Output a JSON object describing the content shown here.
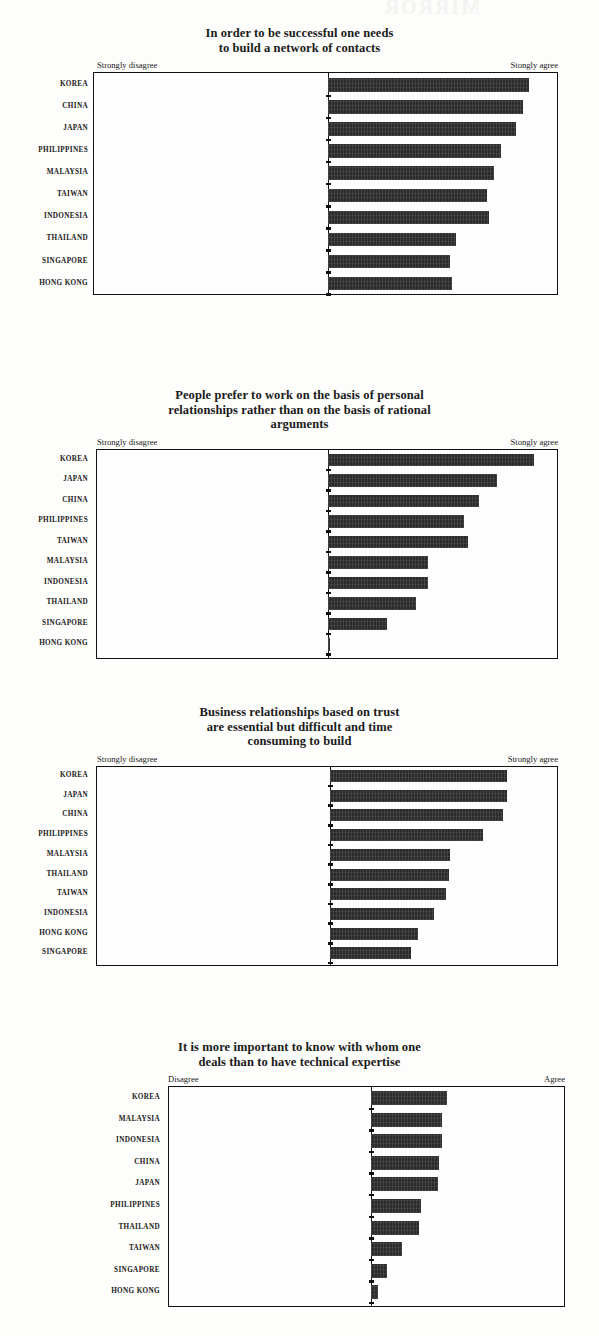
{
  "page": {
    "artifact_text": "MIRROR"
  },
  "chart_data": [
    {
      "id": "chart-1",
      "type": "bar",
      "orientation": "horizontal",
      "title": "In order to be successful one needs to build a network of contacts",
      "title_lines": [
        "In order to be successful one needs",
        "to build a network of contacts"
      ],
      "xlabel_left": "Strongly disagree",
      "xlabel_right": "Stongly agree",
      "categories": [
        "KOREA",
        "CHINA",
        "JAPAN",
        "PHILIPPINES",
        "MALAYSIA",
        "TAIWAN",
        "INDONESIA",
        "THAILAND",
        "SINGAPORE",
        "HONG KONG"
      ],
      "values": [
        87.0,
        84.5,
        81.5,
        75.0,
        72.0,
        69.0,
        69.5,
        55.5,
        53.0,
        53.5
      ],
      "xlim": [
        0,
        100
      ],
      "grid": false,
      "legend": "none"
    },
    {
      "id": "chart-2",
      "type": "bar",
      "orientation": "horizontal",
      "title": "People prefer to work on the basis of personal relationships rather than on the basis of rational arguments",
      "title_lines": [
        "People prefer to work on the basis of personal",
        "relationships rather than on the basis of rational",
        "arguments"
      ],
      "xlabel_left": "Strongly disagree",
      "xlabel_right": "Stongly agree",
      "categories": [
        "KOREA",
        "JAPAN",
        "CHINA",
        "PHILIPPINES",
        "TAIWAN",
        "MALAYSIA",
        "INDONESIA",
        "THAILAND",
        "SINGAPORE",
        "HONG KONG"
      ],
      "values": [
        89.0,
        73.0,
        65.5,
        59.0,
        60.5,
        43.5,
        43.5,
        38.0,
        25.5,
        0.8
      ],
      "xlim": [
        0,
        100
      ],
      "grid": false,
      "legend": "none"
    },
    {
      "id": "chart-3",
      "type": "bar",
      "orientation": "horizontal",
      "title": "Business relationships based on trust are essential but difficult and time consuming to build",
      "title_lines": [
        "Business relationships based on trust",
        "are essential but difficult and time",
        "consuming to build"
      ],
      "xlabel_left": "Strongly disagree",
      "xlabel_right": "Strongly agree",
      "categories": [
        "KOREA",
        "JAPAN",
        "CHINA",
        "PHILIPPINES",
        "MALAYSIA",
        "THAILAND",
        "TAIWAN",
        "INDONESIA",
        "HONG KONG",
        "SINGAPORE"
      ],
      "values": [
        77.5,
        77.5,
        75.5,
        67.0,
        52.5,
        52.0,
        50.5,
        45.5,
        38.5,
        35.5
      ],
      "xlim": [
        0,
        100
      ],
      "grid": false,
      "legend": "none"
    },
    {
      "id": "chart-4",
      "type": "bar",
      "orientation": "horizontal",
      "title": "It is more important to know with whom one deals than to have technical expertise",
      "title_lines": [
        "It is more important to know with whom one",
        "deals than to have technical expertise"
      ],
      "xlabel_left": "Disagree",
      "xlabel_right": "Agree",
      "categories": [
        "KOREA",
        "MALAYSIA",
        "INDONESIA",
        "CHINA",
        "JAPAN",
        "PHILIPPINES",
        "THAILAND",
        "TAIWAN",
        "SINGAPORE",
        "HONG KONG"
      ],
      "values": [
        39.0,
        36.5,
        36.5,
        35.0,
        34.5,
        25.5,
        24.5,
        16.0,
        8.0,
        3.5
      ],
      "xlim": [
        0,
        100
      ],
      "grid": false,
      "legend": "none"
    }
  ]
}
